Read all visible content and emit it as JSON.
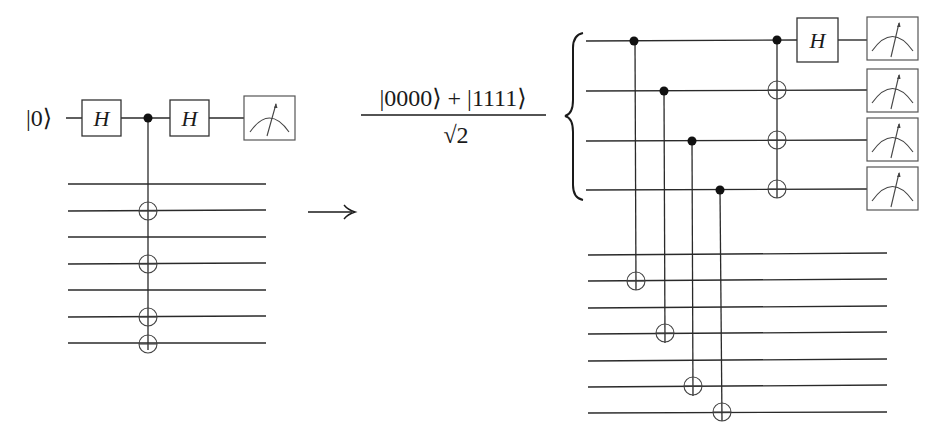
{
  "left_circuit": {
    "input_label": "|0⟩",
    "gates": [
      {
        "type": "H",
        "label": "H"
      },
      {
        "type": "control",
        "label": ""
      },
      {
        "type": "H",
        "label": "H"
      },
      {
        "type": "measure",
        "label": ""
      }
    ],
    "ancilla_wires": 7,
    "cnot_target_wires": [
      2,
      4,
      6,
      7
    ]
  },
  "arrow": {
    "symbol": "⟶"
  },
  "state": {
    "numerator": "|0000⟩ + |1111⟩",
    "denominator": "√2"
  },
  "right_circuit": {
    "top_wires": 4,
    "bottom_wires": 7,
    "cnots": [
      {
        "control_wire": 1,
        "target_bottom_wire": 2
      },
      {
        "control_wire": 2,
        "target_bottom_wire": 4
      },
      {
        "control_wire": 3,
        "target_bottom_wire": 6
      },
      {
        "control_wire": 4,
        "target_bottom_wire": 7
      }
    ],
    "final_gate": {
      "type": "H",
      "label": "H",
      "wire": 1
    },
    "measurements": 4
  },
  "colors": {
    "line": "#2a2a2a",
    "background": "#ffffff"
  }
}
